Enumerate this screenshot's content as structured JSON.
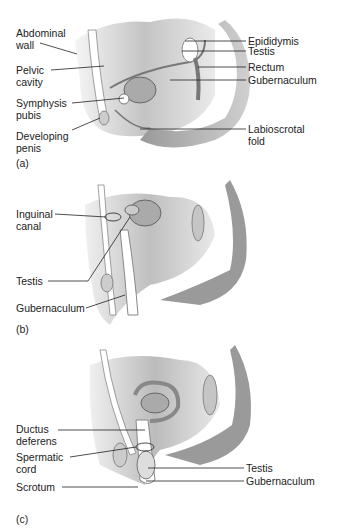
{
  "figure": {
    "panels": [
      {
        "id": "a",
        "caption": "(a)",
        "labels_left": [
          {
            "line1": "Abdominal",
            "line2": "wall"
          },
          {
            "line1": "Pelvic",
            "line2": "cavity"
          },
          {
            "line1": "Symphysis",
            "line2": "pubis"
          },
          {
            "line1": "Developing",
            "line2": "penis"
          }
        ],
        "labels_right": [
          {
            "line1": "Epididymis"
          },
          {
            "line1": "Testis"
          },
          {
            "line1": "Rectum"
          },
          {
            "line1": "Gubernaculum"
          },
          {
            "line1": "Labioscrotal",
            "line2": "fold"
          }
        ]
      },
      {
        "id": "b",
        "caption": "(b)",
        "labels_left": [
          {
            "line1": "Inguinal",
            "line2": "canal"
          },
          {
            "line1": "Testis"
          },
          {
            "line1": "Gubernaculum"
          }
        ]
      },
      {
        "id": "c",
        "caption": "(c)",
        "labels_left": [
          {
            "line1": "Ductus",
            "line2": "deferens"
          },
          {
            "line1": "Spermatic",
            "line2": "cord"
          },
          {
            "line1": "Scrotum"
          }
        ],
        "labels_right": [
          {
            "line1": "Testis"
          },
          {
            "line1": "Gubernaculum"
          }
        ]
      }
    ]
  }
}
